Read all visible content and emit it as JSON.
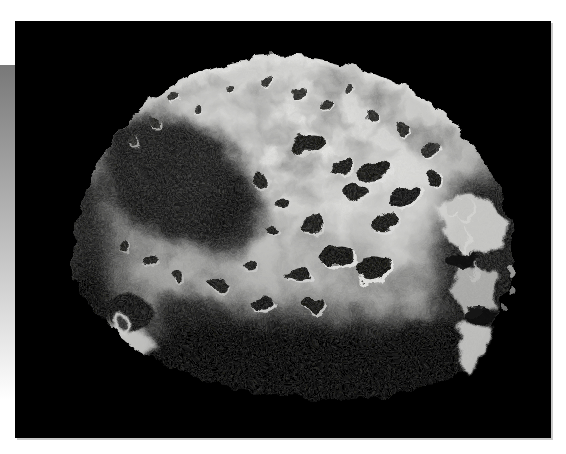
{
  "page": {
    "background_color": "#ffffff"
  },
  "decor": {
    "strip_top_color": "#787878",
    "strip_bottom_color": "#ffffff"
  },
  "photo": {
    "alt": "Grayscale space photograph of a heavily cratered, irregularly shaped moon against a black sky, brightly lit from the upper left with deep shadows across its lower half",
    "space_color": "#000000",
    "edge_shadow_color": "#c9c9c9",
    "surface_bright_color": "#eaeae8",
    "surface_mid_color": "#9b9b99",
    "surface_dark_color": "#4c4c4a"
  }
}
